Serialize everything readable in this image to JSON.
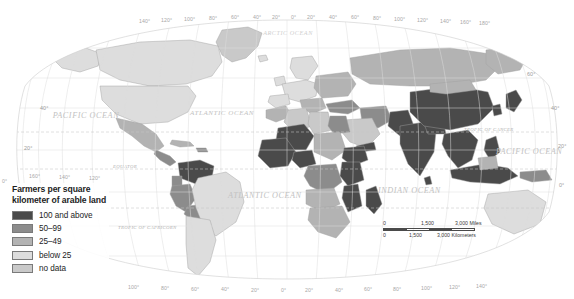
{
  "map": {
    "title": "World map of farmers per square kilometer of arable land",
    "projection": "Robinson"
  },
  "legend": {
    "title": "Farmers per square\nkilometer of arable land",
    "items": [
      {
        "label": "100 and above",
        "color": "#4a4a4a"
      },
      {
        "label": "50–99",
        "color": "#8c8c8c"
      },
      {
        "label": "25–49",
        "color": "#b3b3b3"
      },
      {
        "label": "below 25",
        "color": "#dddddd"
      },
      {
        "label": "no data",
        "color": "#c9c9c9"
      }
    ]
  },
  "scalebar": {
    "miles": {
      "ticks": [
        "0",
        "1,500",
        "3,000 Miles"
      ]
    },
    "kilometers": {
      "ticks": [
        "0",
        "1,500",
        "3,000 Kilometers"
      ]
    }
  },
  "graticule": {
    "top_longitudes": [
      "140°",
      "120°",
      "100°",
      "80°",
      "60°",
      "40°",
      "20°",
      "0°",
      "20°",
      "40°",
      "60°",
      "80°",
      "100°",
      "120°",
      "140°",
      "160°",
      "180°"
    ],
    "bottom_longitudes": [
      "100°",
      "80°",
      "60°",
      "40°",
      "20°",
      "0°",
      "20°",
      "40°",
      "60°",
      "80°",
      "100°",
      "120°",
      "140°"
    ],
    "left_longitudes": [
      "160°",
      "140°",
      "120°",
      "0°"
    ],
    "left_latitudes": [
      "40°",
      "20°"
    ],
    "right_latitudes": [
      "60°",
      "40°",
      "20°",
      "0°"
    ]
  },
  "reference_lines": {
    "tropic_of_cancer": "TROPIC OF CANCER",
    "tropic_of_capricorn": "TROPIC OF CAPRICORN",
    "equator": "EQUATOR"
  },
  "oceans": [
    {
      "name": "PACIFIC\nOCEAN",
      "id": "pacific-west"
    },
    {
      "name": "PACIFIC\nOCEAN",
      "id": "pacific-east"
    },
    {
      "name": "ATLANTIC\nOCEAN",
      "id": "atlantic-north"
    },
    {
      "name": "ATLANTIC\nOCEAN",
      "id": "atlantic-south"
    },
    {
      "name": "INDIAN\nOCEAN",
      "id": "indian"
    },
    {
      "name": "ARCTIC\nOCEAN",
      "id": "arctic"
    }
  ],
  "colors": {
    "class_100_plus": "#4a4a4a",
    "class_50_99": "#8c8c8c",
    "class_25_49": "#b3b3b3",
    "class_below_25": "#dddddd",
    "class_no_data": "#c9c9c9",
    "ocean": "#ffffff",
    "graticule": "#d8d8d8",
    "coastline": "#a0a0a0"
  }
}
